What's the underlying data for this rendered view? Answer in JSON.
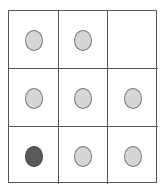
{
  "grid": {
    "rows": 3,
    "cols": 3,
    "cells": [
      {
        "row": 1,
        "col": 1,
        "dot": "light"
      },
      {
        "row": 1,
        "col": 2,
        "dot": "light"
      },
      {
        "row": 1,
        "col": 3,
        "dot": "none"
      },
      {
        "row": 2,
        "col": 1,
        "dot": "light"
      },
      {
        "row": 2,
        "col": 2,
        "dot": "light"
      },
      {
        "row": 2,
        "col": 3,
        "dot": "light"
      },
      {
        "row": 3,
        "col": 1,
        "dot": "dark"
      },
      {
        "row": 3,
        "col": 2,
        "dot": "light"
      },
      {
        "row": 3,
        "col": 3,
        "dot": "light"
      }
    ],
    "colors": {
      "light": "#d6d6d6",
      "dark": "#5a5a5a",
      "border": "#555555"
    }
  }
}
